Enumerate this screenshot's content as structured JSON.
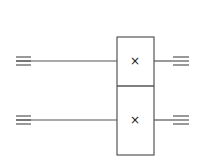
{
  "diagram": {
    "type": "quantum-circuit",
    "stroke_color": "#555555",
    "wires": [
      {
        "id": "wire-1",
        "y": 61,
        "x_start": 16,
        "x_end": 189,
        "left_terminal": "triple-line",
        "right_terminal": "triple-line"
      },
      {
        "id": "wire-2",
        "y": 120,
        "x_start": 16,
        "x_end": 189,
        "left_terminal": "triple-line",
        "right_terminal": "triple-line"
      }
    ],
    "gate": {
      "label": "multi-qubit block",
      "x": 117,
      "y": 37,
      "width": 37,
      "height": 118,
      "divider_y": 86,
      "cells": [
        {
          "symbol": "×",
          "cx": 135,
          "cy": 61
        },
        {
          "symbol": "×",
          "cx": 135,
          "cy": 120
        }
      ]
    }
  }
}
